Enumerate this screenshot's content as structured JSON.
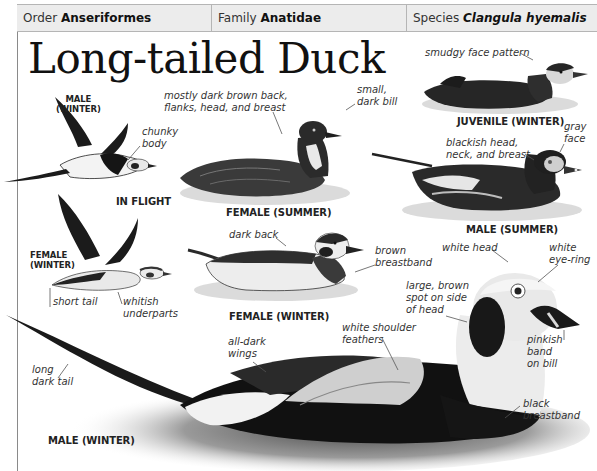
{
  "header": {
    "order_prefix": "Order",
    "order_value": "Anseriformes",
    "family_prefix": "Family",
    "family_value": "Anatidae",
    "species_prefix": "Species",
    "species_value": "Clangula hyemalis"
  },
  "title": "Long-tailed Duck",
  "figures": {
    "flight_male": {
      "caption": "MALE (WINTER)",
      "caption_line1": "MALE",
      "caption_line2": "(WINTER)",
      "labels": {
        "chunky_body": [
          "chunky",
          "body"
        ]
      }
    },
    "in_flight_caption": "IN FLIGHT",
    "flight_female": {
      "caption_line1": "FEMALE",
      "caption_line2": "(WINTER)",
      "labels": {
        "short_tail": "short tail",
        "whitish_underparts": [
          "whitish",
          "underparts"
        ]
      }
    },
    "female_summer": {
      "caption": "FEMALE (SUMMER)",
      "labels": {
        "back": [
          "mostly dark brown back,",
          "flanks, head, and breast"
        ],
        "bill": [
          "small,",
          "dark bill"
        ]
      }
    },
    "juvenile_winter": {
      "caption": "JUVENILE (WINTER)",
      "labels": {
        "face": "smudgy face pattern"
      }
    },
    "male_summer": {
      "caption": "MALE (SUMMER)",
      "labels": {
        "head": [
          "blackish head,",
          "neck, and breast"
        ],
        "face": [
          "gray",
          "face"
        ]
      }
    },
    "female_winter": {
      "caption": "FEMALE (WINTER)",
      "labels": {
        "back": "dark back",
        "breastband": [
          "brown",
          "breastband"
        ]
      }
    },
    "male_winter": {
      "caption": "MALE (WINTER)",
      "labels": {
        "white_head": "white head",
        "eye_ring": [
          "white",
          "eye-ring"
        ],
        "brown_spot": [
          "large, brown",
          "spot on side",
          "of head"
        ],
        "shoulder": [
          "white shoulder",
          "feathers"
        ],
        "wings": [
          "all-dark",
          "wings"
        ],
        "tail": [
          "long",
          "dark tail"
        ],
        "bill": [
          "pinkish",
          "band",
          "on bill"
        ],
        "breastband": [
          "black",
          "breastband"
        ]
      }
    }
  },
  "colors": {
    "header_bg": "#ececec",
    "rule": "#b5b5b5",
    "text": "#111111",
    "label_text": "#333333"
  }
}
